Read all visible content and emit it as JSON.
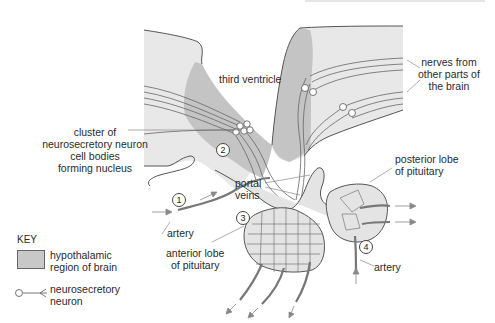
{
  "diagram": {
    "labels": {
      "third_ventricle": "third ventricle",
      "nerves": [
        "nerves from",
        "other parts of",
        "the brain"
      ],
      "cluster": [
        "cluster of",
        "neurosecretory neuron",
        "cell bodies",
        "forming nucleus"
      ],
      "portal_veins": [
        "portal",
        "veins"
      ],
      "posterior_lobe": [
        "posterior lobe",
        "of pituitary"
      ],
      "artery_1": "artery",
      "anterior_lobe": [
        "anterior lobe",
        "of pituitary"
      ],
      "artery_4": "artery"
    },
    "numbers": [
      "1",
      "2",
      "3",
      "4"
    ],
    "key": {
      "title": "KEY",
      "items": [
        {
          "symbol": "gray-swatch",
          "label": [
            "hypothalamic",
            "region of brain"
          ]
        },
        {
          "symbol": "neuron-icon",
          "label": [
            "neurosecretory",
            "neuron"
          ]
        }
      ]
    },
    "colors": {
      "brain_tissue": "#e8e8e8",
      "hypothalamic_region": "#c4c4c4",
      "pituitary": "#e4e4e4",
      "outline": "#555555",
      "vessel": "#777777"
    }
  }
}
